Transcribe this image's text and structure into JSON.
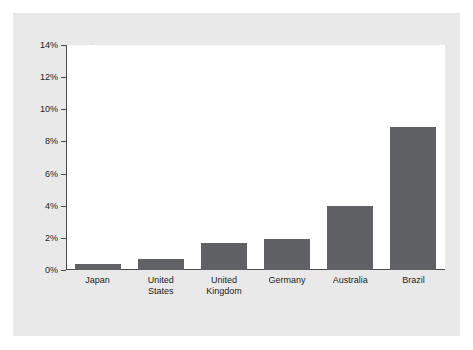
{
  "top_caption": "",
  "chart_data": {
    "type": "bar",
    "title": "",
    "subtitle": "",
    "xlabel": "",
    "ylabel": "One-year Interest Rates",
    "categories": [
      "Japan",
      "United States",
      "United Kingdom",
      "Germany",
      "Australia",
      "Brazil"
    ],
    "category_lines": [
      [
        "Japan"
      ],
      [
        "United",
        "States"
      ],
      [
        "United",
        "Kingdom"
      ],
      [
        "Germany"
      ],
      [
        "Australia"
      ],
      [
        "Brazil"
      ]
    ],
    "values": [
      0.4,
      0.7,
      1.7,
      1.95,
      4.0,
      8.9
    ],
    "value_labels": [
      "0.4%",
      "0.7%",
      "1.7%",
      "2.0%",
      "4.0%",
      "8.9%"
    ],
    "ylim": [
      0,
      14
    ],
    "ytick_values": [
      0,
      2,
      4,
      6,
      8,
      10,
      12,
      14
    ],
    "ytick_labels": [
      "0%",
      "2%",
      "4%",
      "6%",
      "8%",
      "10%",
      "12%",
      "14%"
    ],
    "grid": false,
    "legend": false,
    "legend_position": "none",
    "bar_color": "#5f6164",
    "plot_background": "#ffffff",
    "panel_background": "#e9e9e9",
    "axis_color": "#4a4a4a",
    "text_color": "#1d1d1d"
  }
}
